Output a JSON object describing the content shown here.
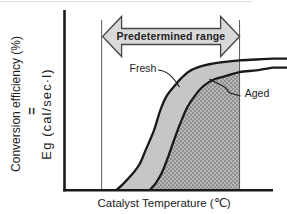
{
  "figure": {
    "arrow_label": "Predetermined range",
    "x_axis_label": "Catalyst Temperature (℃)",
    "y_axis_label": "Conversion efficiency (%)",
    "y_axis_equals": "=",
    "y_axis_sub_label": "Eg (cal/sec·l)",
    "fresh_curve_label": "Fresh",
    "aged_curve_label": "Aged"
  },
  "colors": {
    "curve": "#1a1a1a",
    "axis": "#1a1a1a",
    "band_fill": "#c6c6c6",
    "dark_fill_base": "#b6b6b6",
    "dark_fill_dot": "#828282",
    "arrow_fill": "#d9d9d9",
    "arrow_outline": "#454545",
    "boundary_line": "#5a5a5a",
    "artifact_line": "#cdcdcd"
  },
  "chart_data": {
    "type": "line",
    "title": "",
    "xlabel": "Catalyst Temperature (℃)",
    "ylabel": "Conversion efficiency (%) = Eg (cal/sec·l)",
    "grid": false,
    "axis_ticks": "none (qualitative figure, no numeric scale)",
    "axis_range_normalized": {
      "x": [
        0,
        100
      ],
      "y": [
        0,
        100
      ]
    },
    "series": [
      {
        "name": "Fresh",
        "points": [
          [
            25,
            0
          ],
          [
            28,
            3
          ],
          [
            32,
            8
          ],
          [
            36,
            14
          ],
          [
            39,
            22
          ],
          [
            43,
            33
          ],
          [
            46,
            44
          ],
          [
            49,
            52
          ],
          [
            53,
            58
          ],
          [
            56,
            62
          ],
          [
            60,
            66
          ],
          [
            65,
            68.5
          ],
          [
            70,
            70
          ],
          [
            76,
            71
          ],
          [
            84,
            72
          ],
          [
            92,
            72.5
          ],
          [
            100,
            73
          ]
        ]
      },
      {
        "name": "Aged",
        "points": [
          [
            41,
            0
          ],
          [
            44,
            4
          ],
          [
            47,
            10
          ],
          [
            50,
            19
          ],
          [
            53,
            29
          ],
          [
            56,
            38
          ],
          [
            59,
            46
          ],
          [
            63,
            53
          ],
          [
            67,
            58
          ],
          [
            72,
            61.5
          ],
          [
            78,
            63.5
          ],
          [
            84,
            65.5
          ],
          [
            92,
            66.5
          ],
          [
            100,
            68
          ]
        ]
      }
    ],
    "annotations": [
      {
        "label": "Predetermined range",
        "type": "double-headed-arrow",
        "x_start": 18,
        "x_end": 84
      }
    ],
    "regions": [
      {
        "name": "band-between-fresh-and-aged",
        "fill": "light-gray",
        "bounds": "between Fresh and Aged curves, left of range end"
      },
      {
        "name": "below-aged-within-range",
        "fill": "dark-stipple",
        "bounds": "under Aged curve down to x-axis, up to range end"
      }
    ],
    "legend": "inline labels with leader lines"
  }
}
